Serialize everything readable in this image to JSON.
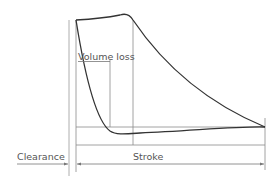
{
  "diagram": {
    "labels": {
      "volume_loss_underlined": "Volume",
      "volume_loss_rest": " loss",
      "clearance": "Clearance",
      "stroke": "Stroke"
    },
    "colors": {
      "curve": "#333333",
      "guide": "#8a8a8a",
      "text": "#555555"
    }
  }
}
